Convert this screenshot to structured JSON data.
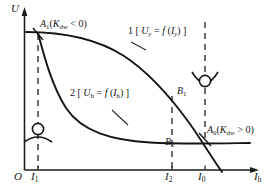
{
  "figure": {
    "type": "technical-line-diagram",
    "axes": {
      "y_label": "U",
      "x_label": "I",
      "x_label_sub": "h",
      "origin_label": "O"
    },
    "x_ticks": [
      {
        "id": "i1",
        "base": "I",
        "sub": "1"
      },
      {
        "id": "i2",
        "base": "I",
        "sub": "2"
      },
      {
        "id": "i0",
        "base": "I",
        "sub": "0"
      }
    ],
    "curves": [
      {
        "id": "curve-1",
        "number": "1",
        "label": "1 [ U y = f ( I y ) ]",
        "label_parts": {
          "num": "1",
          "open": "[",
          "var": "U",
          "var_sub": "y",
          "eq": "=",
          "fn": "f",
          "arg_open": "(",
          "arg": "I",
          "arg_sub": "y",
          "arg_close": ")",
          "close": "]"
        }
      },
      {
        "id": "curve-2",
        "number": "2",
        "label": "2 [ U h = f ( I h ) ]",
        "label_parts": {
          "num": "2",
          "open": "[",
          "var": "U",
          "var_sub": "h",
          "eq": "=",
          "fn": "f",
          "arg_open": "(",
          "arg": "I",
          "arg_sub": "h",
          "arg_close": ")",
          "close": "]"
        }
      }
    ],
    "points": [
      {
        "id": "a1",
        "base": "A",
        "sub": "1",
        "condition": "( K dw < 0 )",
        "condition_parts": {
          "open": "(",
          "k": "K",
          "k_sub": "dw",
          "rel": "<",
          "val": "0",
          "close": ")"
        },
        "meaning": "unstable operating point"
      },
      {
        "id": "a0",
        "base": "A",
        "sub": "0",
        "condition": "( K dw > 0 )",
        "condition_parts": {
          "open": "(",
          "k": "K",
          "k_sub": "dw",
          "rel": ">",
          "val": "0",
          "close": ")"
        },
        "meaning": "stable operating point"
      },
      {
        "id": "b1",
        "base": "B",
        "sub": "1"
      },
      {
        "id": "b2",
        "base": "B",
        "sub": "2"
      }
    ],
    "equilibrium_icons": [
      {
        "id": "unstable-equilibrium-icon",
        "kind": "ball-on-convex-hill",
        "at": "I1"
      },
      {
        "id": "stable-equilibrium-icon",
        "kind": "ball-in-concave-valley",
        "at": "I0"
      }
    ],
    "colors": {
      "ink": "#161616",
      "axis": "#2a2a2a",
      "dashed": "#4a4a4a",
      "background": "#ffffff"
    }
  }
}
